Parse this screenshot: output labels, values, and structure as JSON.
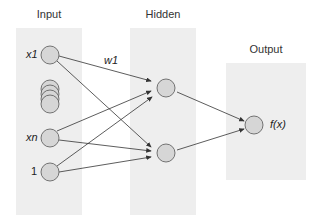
{
  "layers": {
    "input": {
      "title": "Input",
      "labels": {
        "x1": "x1",
        "xn": "xn",
        "bias": "1"
      }
    },
    "hidden": {
      "title": "Hidden"
    },
    "output": {
      "title": "Output",
      "label": "f(x)"
    }
  },
  "weight_label": "w1",
  "colors": {
    "panel": "#eeeeee",
    "node_fill": "#d6d6d6",
    "node_stroke": "#555555",
    "edge": "#333333"
  }
}
